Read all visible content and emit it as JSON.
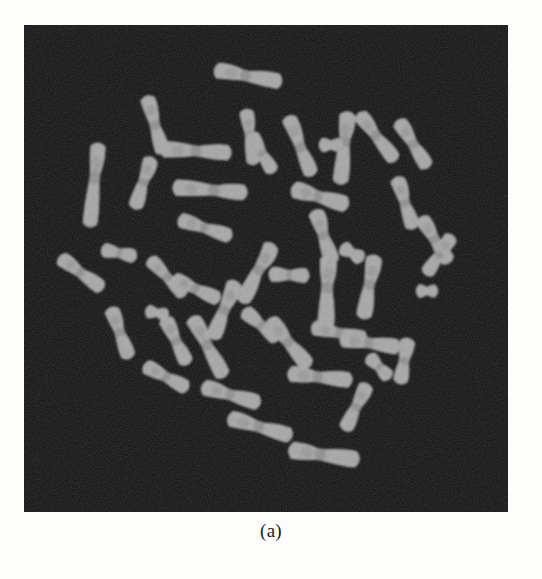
{
  "figure": {
    "caption": "(a)",
    "panel_label": "(a)",
    "modality": "light-microscopy-metaphase-spread",
    "specimen": "metaphase chromosome spread",
    "panel_background_color": "#161616",
    "chromosome_color": "#b9b9b9",
    "chromosome_band_color": "#8f8f8f",
    "page_background_color": "#fdfdfc",
    "panel_rect": {
      "x": 24,
      "y": 25,
      "width": 484,
      "height": 487
    },
    "chromosome_count": 46
  },
  "chart_data": {
    "type": "scatter",
    "title": "(a)",
    "subtitle": "",
    "xlabel": "",
    "ylabel": "",
    "xlim": [
      0,
      484
    ],
    "ylim": [
      0,
      487
    ],
    "grid": false,
    "legend": "none",
    "annotations": [
      "(a)"
    ],
    "note": "Object positions, sizes and orientations of each segmented chromosome within the micrograph panel (panel-local pixel coordinates).",
    "series": [
      {
        "name": "chromosomes",
        "objects": [
          {
            "id": 1,
            "cx": 224,
            "cy": 51,
            "len": 62,
            "wid": 17,
            "angle": 10,
            "centromere": 0.46,
            "bend": 10
          },
          {
            "id": 2,
            "cx": 131,
            "cy": 100,
            "len": 54,
            "wid": 16,
            "angle": 74,
            "centromere": 0.5,
            "bend": 8
          },
          {
            "id": 3,
            "cx": 226,
            "cy": 112,
            "len": 50,
            "wid": 15,
            "angle": 82,
            "centromere": 0.45,
            "bend": 6
          },
          {
            "id": 4,
            "cx": 276,
            "cy": 121,
            "len": 58,
            "wid": 16,
            "angle": 68,
            "centromere": 0.52,
            "bend": 12
          },
          {
            "id": 5,
            "cx": 320,
            "cy": 123,
            "len": 66,
            "wid": 17,
            "angle": 96,
            "centromere": 0.4,
            "bend": 8
          },
          {
            "id": 6,
            "cx": 70,
            "cy": 160,
            "len": 78,
            "wid": 16,
            "angle": 96,
            "centromere": 0.4,
            "bend": 4
          },
          {
            "id": 7,
            "cx": 172,
            "cy": 126,
            "len": 64,
            "wid": 17,
            "angle": 3,
            "centromere": 0.5,
            "bend": 4
          },
          {
            "id": 8,
            "cx": 119,
            "cy": 158,
            "len": 48,
            "wid": 16,
            "angle": 108,
            "centromere": 0.48,
            "bend": 14
          },
          {
            "id": 9,
            "cx": 238,
            "cy": 128,
            "len": 40,
            "wid": 15,
            "angle": 60,
            "centromere": 0.5,
            "bend": 6
          },
          {
            "id": 10,
            "cx": 353,
            "cy": 112,
            "len": 54,
            "wid": 16,
            "angle": 52,
            "centromere": 0.46,
            "bend": 10
          },
          {
            "id": 11,
            "cx": 389,
            "cy": 119,
            "len": 50,
            "wid": 16,
            "angle": 58,
            "centromere": 0.5,
            "bend": 8
          },
          {
            "id": 12,
            "cx": 307,
            "cy": 120,
            "len": 18,
            "wid": 15,
            "angle": 0,
            "centromere": 0.5,
            "bend": 0
          },
          {
            "id": 13,
            "cx": 186,
            "cy": 165,
            "len": 68,
            "wid": 17,
            "angle": 4,
            "centromere": 0.56,
            "bend": 4
          },
          {
            "id": 14,
            "cx": 296,
            "cy": 172,
            "len": 52,
            "wid": 18,
            "angle": 16,
            "centromere": 0.46,
            "bend": 6
          },
          {
            "id": 15,
            "cx": 381,
            "cy": 178,
            "len": 48,
            "wid": 16,
            "angle": 72,
            "centromere": 0.5,
            "bend": 14
          },
          {
            "id": 16,
            "cx": 181,
            "cy": 203,
            "len": 50,
            "wid": 16,
            "angle": 18,
            "centromere": 0.48,
            "bend": 6
          },
          {
            "id": 17,
            "cx": 300,
            "cy": 212,
            "len": 50,
            "wid": 17,
            "angle": 72,
            "centromere": 0.46,
            "bend": 12
          },
          {
            "id": 18,
            "cx": 411,
            "cy": 215,
            "len": 48,
            "wid": 16,
            "angle": 58,
            "centromere": 0.48,
            "bend": 10
          },
          {
            "id": 19,
            "cx": 95,
            "cy": 228,
            "len": 30,
            "wid": 15,
            "angle": 12,
            "centromere": 0.5,
            "bend": 4
          },
          {
            "id": 20,
            "cx": 328,
            "cy": 228,
            "len": 20,
            "wid": 16,
            "angle": 30,
            "centromere": 0.5,
            "bend": 0
          },
          {
            "id": 21,
            "cx": 57,
            "cy": 248,
            "len": 48,
            "wid": 16,
            "angle": 36,
            "centromere": 0.48,
            "bend": 10
          },
          {
            "id": 22,
            "cx": 143,
            "cy": 252,
            "len": 46,
            "wid": 15,
            "angle": 46,
            "centromere": 0.5,
            "bend": 8
          },
          {
            "id": 23,
            "cx": 233,
            "cy": 248,
            "len": 60,
            "wid": 17,
            "angle": 118,
            "centromere": 0.44,
            "bend": 20
          },
          {
            "id": 24,
            "cx": 265,
            "cy": 250,
            "len": 34,
            "wid": 16,
            "angle": 2,
            "centromere": 0.5,
            "bend": 4
          },
          {
            "id": 25,
            "cx": 172,
            "cy": 264,
            "len": 46,
            "wid": 16,
            "angle": 24,
            "centromere": 0.48,
            "bend": 6
          },
          {
            "id": 26,
            "cx": 303,
            "cy": 268,
            "len": 68,
            "wid": 18,
            "angle": 92,
            "centromere": 0.42,
            "bend": 6
          },
          {
            "id": 27,
            "cx": 345,
            "cy": 262,
            "len": 58,
            "wid": 17,
            "angle": 100,
            "centromere": 0.46,
            "bend": 8
          },
          {
            "id": 28,
            "cx": 415,
            "cy": 230,
            "len": 42,
            "wid": 15,
            "angle": 124,
            "centromere": 0.5,
            "bend": 6
          },
          {
            "id": 29,
            "cx": 403,
            "cy": 266,
            "len": 16,
            "wid": 14,
            "angle": 0,
            "centromere": 0.5,
            "bend": 0
          },
          {
            "id": 30,
            "cx": 200,
            "cy": 285,
            "len": 56,
            "wid": 17,
            "angle": 112,
            "centromere": 0.5,
            "bend": 12
          },
          {
            "id": 31,
            "cx": 133,
            "cy": 288,
            "len": 18,
            "wid": 14,
            "angle": 10,
            "centromere": 0.5,
            "bend": 0
          },
          {
            "id": 32,
            "cx": 96,
            "cy": 308,
            "len": 48,
            "wid": 16,
            "angle": 70,
            "centromere": 0.48,
            "bend": 10
          },
          {
            "id": 33,
            "cx": 152,
            "cy": 316,
            "len": 46,
            "wid": 16,
            "angle": 64,
            "centromere": 0.5,
            "bend": 8
          },
          {
            "id": 34,
            "cx": 237,
            "cy": 300,
            "len": 40,
            "wid": 16,
            "angle": 40,
            "centromere": 0.5,
            "bend": 6
          },
          {
            "id": 35,
            "cx": 184,
            "cy": 322,
            "len": 62,
            "wid": 17,
            "angle": 62,
            "centromere": 0.46,
            "bend": 10
          },
          {
            "id": 36,
            "cx": 265,
            "cy": 318,
            "len": 56,
            "wid": 17,
            "angle": 50,
            "centromere": 0.48,
            "bend": 12
          },
          {
            "id": 37,
            "cx": 315,
            "cy": 308,
            "len": 50,
            "wid": 16,
            "angle": 12,
            "centromere": 0.5,
            "bend": 6
          },
          {
            "id": 38,
            "cx": 346,
            "cy": 318,
            "len": 54,
            "wid": 17,
            "angle": 8,
            "centromere": 0.48,
            "bend": 6
          },
          {
            "id": 39,
            "cx": 355,
            "cy": 342,
            "len": 26,
            "wid": 15,
            "angle": 46,
            "centromere": 0.5,
            "bend": 0
          },
          {
            "id": 40,
            "cx": 142,
            "cy": 352,
            "len": 44,
            "wid": 16,
            "angle": 28,
            "centromere": 0.5,
            "bend": 8
          },
          {
            "id": 41,
            "cx": 296,
            "cy": 352,
            "len": 58,
            "wid": 17,
            "angle": 6,
            "centromere": 0.46,
            "bend": 6
          },
          {
            "id": 42,
            "cx": 380,
            "cy": 336,
            "len": 40,
            "wid": 16,
            "angle": 100,
            "centromere": 0.5,
            "bend": 6
          },
          {
            "id": 43,
            "cx": 207,
            "cy": 370,
            "len": 54,
            "wid": 17,
            "angle": 16,
            "centromere": 0.48,
            "bend": 8
          },
          {
            "id": 44,
            "cx": 332,
            "cy": 382,
            "len": 46,
            "wid": 16,
            "angle": 116,
            "centromere": 0.5,
            "bend": 10
          },
          {
            "id": 45,
            "cx": 236,
            "cy": 402,
            "len": 60,
            "wid": 17,
            "angle": 16,
            "centromere": 0.48,
            "bend": 8
          },
          {
            "id": 46,
            "cx": 300,
            "cy": 430,
            "len": 64,
            "wid": 18,
            "angle": 8,
            "centromere": 0.44,
            "bend": 6
          }
        ]
      }
    ]
  }
}
